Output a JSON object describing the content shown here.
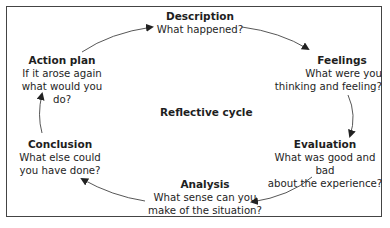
{
  "diagram": {
    "center_label": "Reflective cycle",
    "stages": [
      {
        "title": "Description",
        "text": "What happened?"
      },
      {
        "title": "Feelings",
        "text": "What were you\nthinking and feeling?"
      },
      {
        "title": "Evaluation",
        "text": "What was good and bad\nabout the experience?"
      },
      {
        "title": "Analysis",
        "text": "What sense can you\nmake of the situation?"
      },
      {
        "title": "Conclusion",
        "text": "What else could\nyou have done?"
      },
      {
        "title": "Action plan",
        "text": "If it arose again\nwhat would you do?"
      }
    ],
    "colors": {
      "text": "#1e1e1e",
      "arrow": "#333333",
      "border": "#444444"
    }
  }
}
